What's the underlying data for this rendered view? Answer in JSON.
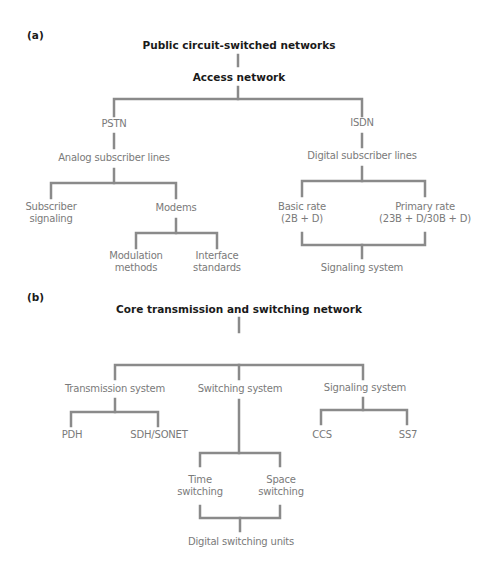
{
  "panel_a": {
    "label": "(a)",
    "root": "Public circuit-switched networks",
    "level1": "Access network",
    "pstn": {
      "label": "PSTN",
      "child": "Analog subscriber lines",
      "branches": {
        "subscriber_signaling": [
          "Subscriber",
          "signaling"
        ],
        "modems": "Modems",
        "modem_children": {
          "modulation": [
            "Modulation",
            "methods"
          ],
          "interface": [
            "Interface",
            "standards"
          ]
        }
      }
    },
    "isdn": {
      "label": "ISDN",
      "child": "Digital subscriber lines",
      "basic_rate": [
        "Basic rate",
        "(2B + D)"
      ],
      "primary_rate": [
        "Primary rate",
        "(23B + D/30B + D)"
      ],
      "merge": "Signaling system"
    }
  },
  "panel_b": {
    "label": "(b)",
    "root": "Core transmission and switching network",
    "transmission": {
      "label": "Transmission system",
      "children": [
        "PDH",
        "SDH/SONET"
      ]
    },
    "switching": {
      "label": "Switching system",
      "time": [
        "Time",
        "switching"
      ],
      "space": [
        "Space",
        "switching"
      ],
      "merge": "Digital switching units"
    },
    "signaling": {
      "label": "Signaling system",
      "children": [
        "CCS",
        "SS7"
      ]
    }
  },
  "colors": {
    "line": "#8a8a8a",
    "node_text": "#7a7a7a",
    "title_text": "#1a1a1a"
  }
}
